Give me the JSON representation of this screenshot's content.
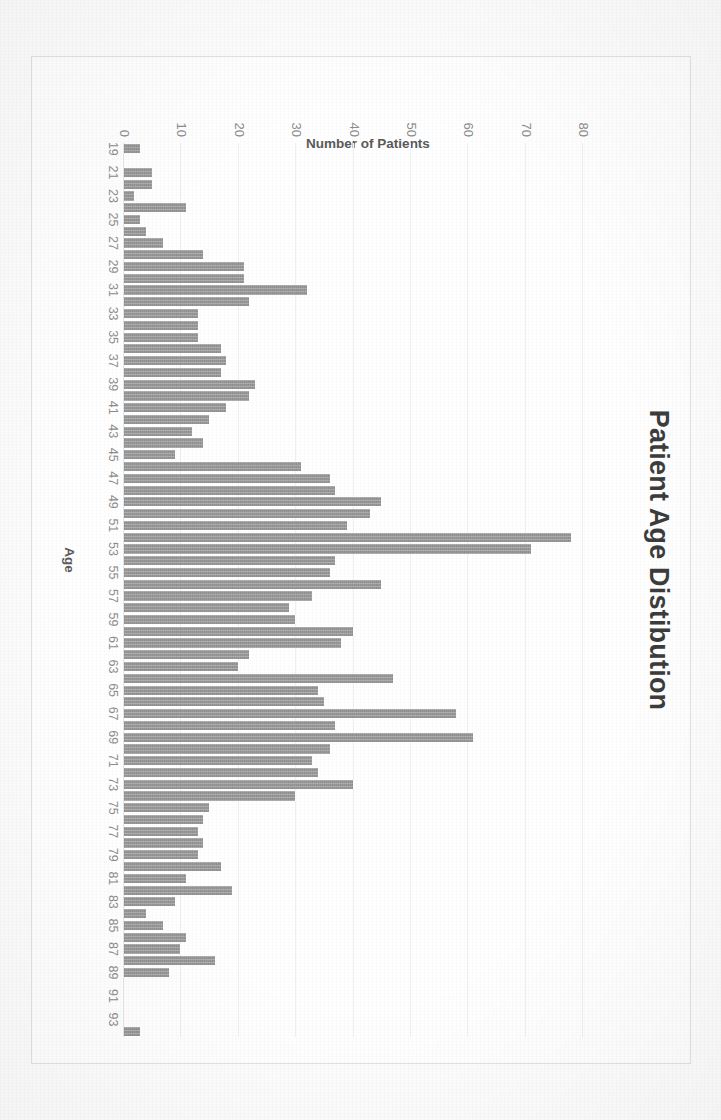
{
  "document": {
    "kind": "scanned-chart-page",
    "background_color": "#fdfdfd"
  },
  "chart_data": {
    "type": "bar",
    "title": "Patient Age Distibution",
    "xlabel": "Age",
    "ylabel": "Number of Patients",
    "ylim": [
      0,
      85
    ],
    "grid": true,
    "legend": null,
    "bar_color": "#9a9a9a",
    "orientation": "vertical-bars-rotated-90deg-clockwise",
    "ytick_labels": [
      "0",
      "10",
      "20",
      "30",
      "40",
      "50",
      "60",
      "70",
      "80"
    ],
    "ytick_values": [
      0,
      10,
      20,
      30,
      40,
      50,
      60,
      70,
      80
    ],
    "xtick_labels": [
      "19",
      "21",
      "23",
      "25",
      "27",
      "29",
      "31",
      "33",
      "35",
      "37",
      "39",
      "41",
      "43",
      "45",
      "47",
      "49",
      "51",
      "53",
      "55",
      "57",
      "59",
      "61",
      "63",
      "65",
      "67",
      "69",
      "71",
      "73",
      "75",
      "77",
      "79",
      "81",
      "83",
      "85",
      "87",
      "89",
      "91",
      "93"
    ],
    "categories": [
      19,
      20,
      21,
      22,
      23,
      24,
      25,
      26,
      27,
      28,
      29,
      30,
      31,
      32,
      33,
      34,
      35,
      36,
      37,
      38,
      39,
      40,
      41,
      42,
      43,
      44,
      45,
      46,
      47,
      48,
      49,
      50,
      51,
      52,
      53,
      54,
      55,
      56,
      57,
      58,
      59,
      60,
      61,
      62,
      63,
      64,
      65,
      66,
      67,
      68,
      69,
      70,
      71,
      72,
      73,
      74,
      75,
      76,
      77,
      78,
      79,
      80,
      81,
      82,
      83,
      84,
      85,
      86,
      87,
      88,
      89,
      90,
      91,
      92,
      93,
      94
    ],
    "values": [
      3,
      0,
      5,
      5,
      2,
      11,
      3,
      4,
      7,
      14,
      21,
      21,
      32,
      22,
      13,
      13,
      13,
      17,
      18,
      17,
      23,
      22,
      18,
      15,
      12,
      14,
      9,
      31,
      36,
      37,
      45,
      43,
      39,
      78,
      71,
      37,
      36,
      45,
      33,
      29,
      30,
      40,
      38,
      22,
      20,
      47,
      34,
      35,
      58,
      37,
      61,
      36,
      33,
      34,
      40,
      30,
      15,
      14,
      13,
      14,
      13,
      17,
      11,
      19,
      9,
      4,
      7,
      11,
      10,
      16,
      8,
      0,
      0,
      0,
      0,
      3
    ]
  }
}
